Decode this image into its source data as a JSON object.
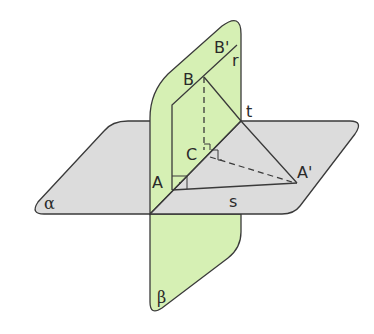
{
  "diagram": {
    "colors": {
      "plane_alpha_fill": "#dcdcdc",
      "plane_beta_fill": "#d6f0b4",
      "stroke": "#3a3a3a"
    },
    "planes": [
      {
        "name": "alpha",
        "label": "α"
      },
      {
        "name": "beta",
        "label": "β"
      }
    ],
    "lines": [
      {
        "name": "r",
        "label": "r"
      },
      {
        "name": "s",
        "label": "s"
      },
      {
        "name": "t",
        "label": "t"
      }
    ],
    "points": [
      {
        "name": "A",
        "label": "A"
      },
      {
        "name": "B",
        "label": "B"
      },
      {
        "name": "B-prime",
        "label": "B'"
      },
      {
        "name": "C",
        "label": "C"
      },
      {
        "name": "A-prime",
        "label": "A'"
      }
    ]
  }
}
